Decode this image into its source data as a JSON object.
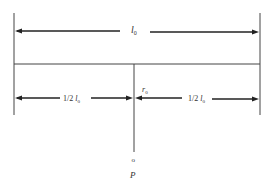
{
  "diagram": {
    "total_length_label": "l",
    "total_length_sub": "0",
    "half_length_prefix": "1/2 ",
    "half_length_var": "l",
    "half_length_sub": "0",
    "radius_label": "r",
    "radius_sub": "0",
    "point_marker": "o",
    "point_label": "P"
  }
}
